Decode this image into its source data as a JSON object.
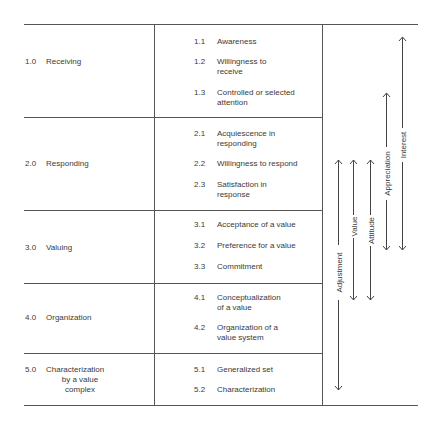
{
  "categories": [
    {
      "num": "1.0",
      "label": "Receiving",
      "sub": [
        {
          "num": "1.1",
          "l1": "Awareness",
          "l2": ""
        },
        {
          "num": "1.2",
          "l1": "Willingness to",
          "l2": "receive"
        },
        {
          "num": "1.3",
          "l1": "Controlled or selected",
          "l2": "attention"
        }
      ]
    },
    {
      "num": "2.0",
      "label": "Responding",
      "sub": [
        {
          "num": "2.1",
          "l1": "Acquiescence in",
          "l2": "responding"
        },
        {
          "num": "2.2",
          "l1": "Willingness to respond",
          "l2": ""
        },
        {
          "num": "2.3",
          "l1": "Satisfaction in",
          "l2": "response"
        }
      ]
    },
    {
      "num": "3.0",
      "label": "Valuing",
      "sub": [
        {
          "num": "3.1",
          "l1": "Acceptance of a value",
          "l2": ""
        },
        {
          "num": "3.2",
          "l1": "Preference for a value",
          "l2": ""
        },
        {
          "num": "3.3",
          "l1": "Commitment",
          "l2": ""
        }
      ]
    },
    {
      "num": "4.0",
      "label": "Organization",
      "sub": [
        {
          "num": "4.1",
          "l1": "Conceptualization",
          "l2": "of a value"
        },
        {
          "num": "4.2",
          "l1": "Organization of a",
          "l2": "value system"
        }
      ]
    },
    {
      "num": "5.0",
      "label": "Characterization",
      "label2": "by a value",
      "label3": "complex",
      "sub": [
        {
          "num": "5.1",
          "l1": "Generalized set",
          "l2": ""
        },
        {
          "num": "5.2",
          "l1": "Characterization",
          "l2": ""
        }
      ]
    }
  ],
  "ranges": [
    {
      "label": "Adjustment",
      "x": 338,
      "top": 160,
      "bottom": 390
    },
    {
      "label": "Value",
      "x": 353,
      "top": 160,
      "bottom": 300
    },
    {
      "label": "Attitude",
      "x": 370,
      "top": 160,
      "bottom": 300
    },
    {
      "label": "Appreciation",
      "x": 386,
      "top": 93,
      "bottom": 250
    },
    {
      "label": "Interest",
      "x": 402,
      "top": 37,
      "bottom": 250
    }
  ]
}
